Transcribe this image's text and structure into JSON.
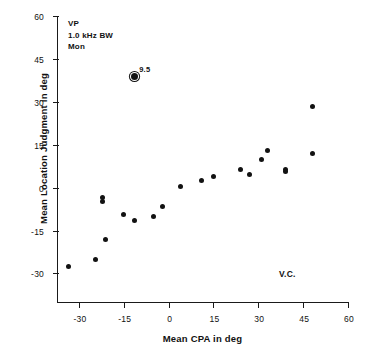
{
  "chart_data": {
    "type": "scatter",
    "title": "",
    "xlabel": "Mean CPA in deg",
    "ylabel": "Mean Location Judgment in deg",
    "xlim": [
      -37,
      60
    ],
    "ylim": [
      -40,
      60
    ],
    "xticks": [
      -30,
      -15,
      0,
      15,
      30,
      45,
      60
    ],
    "xticklabels": [
      "-30",
      "-15",
      "0",
      "15",
      "30",
      "45",
      "60"
    ],
    "yticks": [
      -30,
      -15,
      0,
      15,
      30,
      45,
      60
    ],
    "yticklabels": [
      "-30",
      "-15",
      "0",
      "15",
      "30",
      "45",
      "60"
    ],
    "grid": false,
    "legend_position": "none",
    "points": [
      {
        "x": -33.5,
        "y": -27.5,
        "label": "",
        "marker": "filled-circle"
      },
      {
        "x": -24.5,
        "y": -25.0,
        "label": "",
        "marker": "filled-circle"
      },
      {
        "x": -21.0,
        "y": -18.0,
        "label": "",
        "marker": "filled-circle"
      },
      {
        "x": -22.0,
        "y": -3.5,
        "label": "",
        "marker": "filled-circle"
      },
      {
        "x": -22.0,
        "y": -5.0,
        "label": "",
        "marker": "filled-circle"
      },
      {
        "x": -15.0,
        "y": -9.5,
        "label": "",
        "marker": "filled-circle"
      },
      {
        "x": -11.5,
        "y": -11.5,
        "label": "",
        "marker": "filled-circle"
      },
      {
        "x": -11.5,
        "y": 39.0,
        "label": "9.5",
        "marker": "ringed-circle"
      },
      {
        "x": -5.0,
        "y": -10.0,
        "label": "",
        "marker": "filled-circle"
      },
      {
        "x": -2.0,
        "y": -6.5,
        "label": "",
        "marker": "filled-circle"
      },
      {
        "x": 4.0,
        "y": 0.5,
        "label": "",
        "marker": "filled-circle"
      },
      {
        "x": 11.0,
        "y": 2.5,
        "label": "",
        "marker": "filled-circle"
      },
      {
        "x": 15.0,
        "y": 4.0,
        "label": "",
        "marker": "filled-circle"
      },
      {
        "x": 24.0,
        "y": 6.5,
        "label": "",
        "marker": "filled-circle"
      },
      {
        "x": 27.0,
        "y": 4.5,
        "label": "",
        "marker": "filled-circle"
      },
      {
        "x": 31.0,
        "y": 10.0,
        "label": "",
        "marker": "filled-circle"
      },
      {
        "x": 33.0,
        "y": 13.0,
        "label": "",
        "marker": "filled-circle"
      },
      {
        "x": 39.0,
        "y": 6.5,
        "label": "",
        "marker": "filled-circle"
      },
      {
        "x": 39.0,
        "y": 5.5,
        "label": "",
        "marker": "filled-circle"
      },
      {
        "x": 48.0,
        "y": 12.0,
        "label": "",
        "marker": "filled-circle"
      },
      {
        "x": 48.0,
        "y": 28.5,
        "label": "",
        "marker": "filled-circle"
      }
    ],
    "annotations": [
      {
        "name": "condition-line-1",
        "text": "VP"
      },
      {
        "name": "condition-line-2",
        "text": "1.0 kHz BW"
      },
      {
        "name": "condition-line-3",
        "text": "Mon"
      },
      {
        "name": "subject-initials",
        "text": "V.C."
      }
    ],
    "marker_color": "#121212",
    "axis_color": "#1a1a1a",
    "background_color": "#ffffff"
  },
  "legend_block": {
    "line1": "VP",
    "line2": "1.0 kHz BW",
    "line3": "Mon"
  },
  "corner_note": {
    "text": "V.C."
  }
}
